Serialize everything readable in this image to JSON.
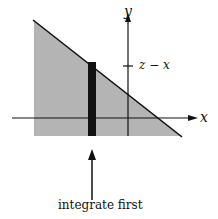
{
  "diagram": {
    "axis_labels": {
      "x": "x",
      "y": "y"
    },
    "tick_label": "z − x",
    "annotation": "integrate first",
    "colors": {
      "region": "#b4b4b4",
      "strip": "#111111",
      "line": "#111111",
      "background": "#ffffff"
    }
  }
}
